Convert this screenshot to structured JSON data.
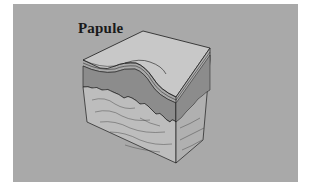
{
  "diagram": {
    "title": "Papule",
    "colors": {
      "background_panel": "#a9a9a9",
      "page": "#ffffff",
      "top_surface": "#c4c4c4",
      "epidermis": "#8a8a8a",
      "dermis": "#b8b8b8",
      "line": "#1a1a1a"
    }
  }
}
